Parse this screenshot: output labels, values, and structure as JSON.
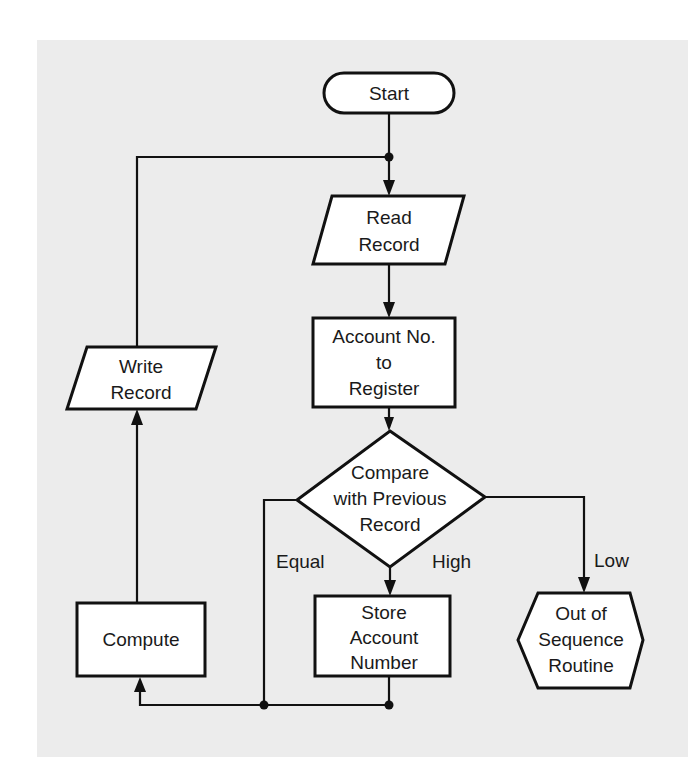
{
  "diagram": {
    "type": "flowchart",
    "colors": {
      "background": "#ececec",
      "stroke": "#111111",
      "fill": "#ffffff"
    },
    "nodes": {
      "start": {
        "shape": "terminal",
        "lines": [
          "Start"
        ]
      },
      "read_record": {
        "shape": "input-output",
        "lines": [
          "Read",
          "Record"
        ]
      },
      "account_to_register": {
        "shape": "process",
        "lines": [
          "Account No.",
          "to",
          "Register"
        ]
      },
      "compare": {
        "shape": "decision",
        "lines": [
          "Compare",
          "with Previous",
          "Record"
        ]
      },
      "store_account": {
        "shape": "process",
        "lines": [
          "Store",
          "Account",
          "Number"
        ]
      },
      "out_of_sequence": {
        "shape": "preparation",
        "lines": [
          "Out of",
          "Sequence",
          "Routine"
        ]
      },
      "compute": {
        "shape": "process",
        "lines": [
          "Compute"
        ]
      },
      "write_record": {
        "shape": "input-output",
        "lines": [
          "Write",
          "Record"
        ]
      }
    },
    "edge_labels": {
      "equal": "Equal",
      "high": "High",
      "low": "Low"
    },
    "edges": [
      {
        "from": "start",
        "to": "read_record"
      },
      {
        "from": "read_record",
        "to": "account_to_register"
      },
      {
        "from": "account_to_register",
        "to": "compare"
      },
      {
        "from": "compare",
        "to": "store_account",
        "label": "High"
      },
      {
        "from": "compare",
        "to": "out_of_sequence",
        "label": "Low"
      },
      {
        "from": "compare",
        "to": "compute",
        "label": "Equal"
      },
      {
        "from": "store_account",
        "to": "compute"
      },
      {
        "from": "compute",
        "to": "write_record"
      },
      {
        "from": "write_record",
        "to": "read_record"
      }
    ]
  }
}
